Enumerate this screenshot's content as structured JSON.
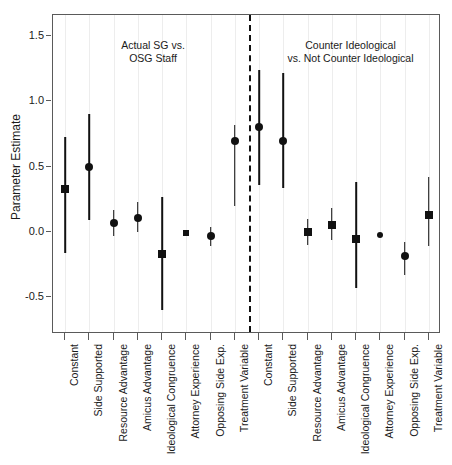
{
  "chart_data": {
    "type": "scatter",
    "title": "",
    "xlabel": "",
    "ylabel": "Parameter Estimate",
    "ylim": [
      -0.78,
      1.66
    ],
    "yticks": [
      1.5,
      1.0,
      0.5,
      0.0,
      -0.5
    ],
    "ytick_labels": [
      "1.5",
      "1.0",
      "0.5",
      "0.0",
      "-0.5"
    ],
    "grid": true,
    "legend": "none",
    "annotations": [
      {
        "text_line1": "Actual SG vs.",
        "text_line2": "OSG Staff",
        "panel": "left"
      },
      {
        "text_line1": "Counter Ideological",
        "text_line2": "vs. Not Counter Ideological",
        "panel": "right"
      }
    ],
    "divider": {
      "type": "dashed-vertical",
      "after_category_index": 6
    },
    "categories": [
      "Constant",
      "Side Supported",
      "Resource Advantage",
      "Amicus Advantage",
      "Ideological Congruence",
      "Attorney Experience",
      "Opposing Side Exp.",
      "Treatment Variable",
      "Constant",
      "Side Supported",
      "Resource Advantage",
      "Amicus Advantage",
      "Ideological Congruence",
      "Attorney Experience",
      "Opposing Side Exp.",
      "Treatment Variable"
    ],
    "points": [
      {
        "label": "Constant",
        "panel": "left",
        "estimate": 0.33,
        "low": 0.73,
        "high": -0.16,
        "marker": "square",
        "size": "normal"
      },
      {
        "label": "Side Supported",
        "panel": "left",
        "estimate": 0.5,
        "low": 0.9,
        "high": 0.09,
        "marker": "circle",
        "size": "normal"
      },
      {
        "label": "Resource Advantage",
        "panel": "left",
        "estimate": 0.07,
        "low": 0.17,
        "high": -0.03,
        "marker": "circle",
        "size": "normal"
      },
      {
        "label": "Amicus Advantage",
        "panel": "left",
        "estimate": 0.11,
        "low": 0.23,
        "high": 0.0,
        "marker": "circle",
        "size": "normal"
      },
      {
        "label": "Ideological Congruence",
        "panel": "left",
        "estimate": -0.17,
        "low": 0.27,
        "high": -0.6,
        "marker": "square",
        "size": "normal"
      },
      {
        "label": "Attorney Experience",
        "panel": "left",
        "estimate": -0.01,
        "low": -0.01,
        "high": -0.01,
        "marker": "square",
        "size": "small"
      },
      {
        "label": "Opposing Side Exp.",
        "panel": "left",
        "estimate": -0.03,
        "low": 0.04,
        "high": -0.11,
        "marker": "circle",
        "size": "normal"
      },
      {
        "label": "Treatment Variable",
        "panel": "left",
        "estimate": 0.7,
        "low": 0.82,
        "high": 0.2,
        "marker": "circle",
        "size": "normal"
      },
      {
        "label": "Constant",
        "panel": "right",
        "estimate": 0.8,
        "low": 1.24,
        "high": 0.36,
        "marker": "circle",
        "size": "normal"
      },
      {
        "label": "Side Supported",
        "panel": "right",
        "estimate": 0.7,
        "low": 1.22,
        "high": 0.34,
        "marker": "circle",
        "size": "normal"
      },
      {
        "label": "Resource Advantage",
        "panel": "right",
        "estimate": 0.0,
        "low": 0.1,
        "high": -0.1,
        "marker": "square",
        "size": "normal"
      },
      {
        "label": "Amicus Advantage",
        "panel": "right",
        "estimate": 0.05,
        "low": 0.18,
        "high": -0.06,
        "marker": "square",
        "size": "normal"
      },
      {
        "label": "Ideological Congruence",
        "panel": "right",
        "estimate": -0.05,
        "low": 0.38,
        "high": -0.43,
        "marker": "square",
        "size": "normal"
      },
      {
        "label": "Attorney Experience",
        "panel": "right",
        "estimate": -0.02,
        "low": -0.02,
        "high": -0.02,
        "marker": "circle",
        "size": "small"
      },
      {
        "label": "Opposing Side Exp.",
        "panel": "right",
        "estimate": -0.18,
        "low": -0.08,
        "high": -0.33,
        "marker": "circle",
        "size": "normal"
      },
      {
        "label": "Treatment Variable",
        "panel": "right",
        "estimate": 0.13,
        "low": 0.42,
        "high": -0.11,
        "marker": "square",
        "size": "normal"
      }
    ]
  }
}
